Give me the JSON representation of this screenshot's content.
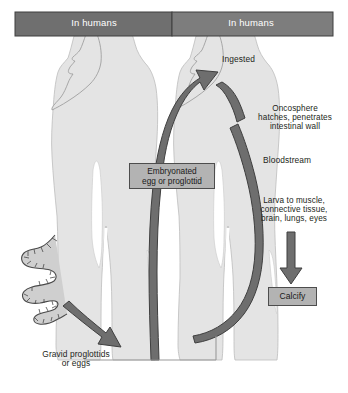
{
  "figure": {
    "background_color": "#ffffff",
    "width": 348,
    "height": 393
  },
  "header": {
    "left_bar": {
      "label": "In humans",
      "color": "#6f6f6f",
      "text_color": "#ffffff"
    },
    "right_bar": {
      "label": "In humans",
      "color": "#7d7d7d",
      "text_color": "#ffffff"
    }
  },
  "labels": {
    "ingested": "Ingested",
    "oncosphere": "Oncosphere\nhatches, penetrates\nintestinal wall",
    "bloodstream": "Bloodstream",
    "larva": "Larva to muscle,\nconnective tissue,\nbrain, lungs, eyes",
    "gravid": "Gravid proglottids\nor eggs"
  },
  "boxes": {
    "embryonated": {
      "label": "Embryonated\negg or proglottid",
      "fill": "#b3b3b3",
      "border": "#4d4d4d"
    },
    "calcify": {
      "label": "Calcify",
      "fill": "#b3b3b3",
      "border": "#4d4d4d"
    }
  },
  "graphics": {
    "body_silhouette_fill": "#e4e4e4",
    "body_silhouette_stroke": "#b0b0b0",
    "arrow_fill": "#6e6e6e",
    "arrow_stroke": "#3f3f3f",
    "tapeworm_fill": "#cfcfcf",
    "tapeworm_stroke": "#4a4a4a",
    "frame_stroke": "#9a9a9a"
  }
}
